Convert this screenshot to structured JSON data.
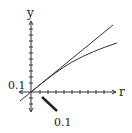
{
  "diagram": {
    "axes": {
      "x_label": "r",
      "y_label": "y",
      "origin_px": [
        31,
        92
      ],
      "x_tick_count": 10,
      "y_tick_count_above": 10,
      "y_tick_count_below": 3
    },
    "labels": {
      "left_scale": "0.1",
      "bottom_scale": "0.1"
    },
    "curves": [
      {
        "name": "straight-line",
        "type": "line",
        "description": "tangent line through origin"
      },
      {
        "name": "concave-curve",
        "type": "curve",
        "description": "curve bending below tangent line"
      }
    ],
    "colors": {
      "ink": "#333333",
      "background": "#ffffff"
    }
  }
}
